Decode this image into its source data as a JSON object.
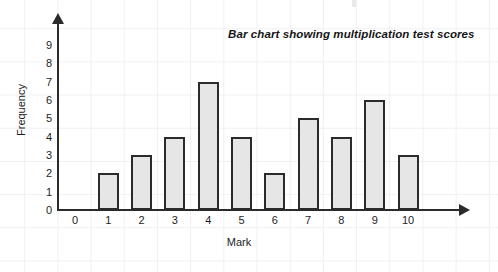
{
  "chart_data": {
    "type": "bar",
    "title": "Bar chart showing multiplication test scores",
    "xlabel": "Mark",
    "ylabel": "Frequency",
    "categories": [
      "0",
      "1",
      "2",
      "3",
      "4",
      "5",
      "6",
      "7",
      "8",
      "9",
      "10"
    ],
    "values": [
      0,
      2,
      3,
      4,
      7,
      4,
      2,
      5,
      4,
      6,
      3
    ],
    "yticks": [
      "0",
      "1",
      "2",
      "3",
      "4",
      "5",
      "6",
      "7",
      "8",
      "9"
    ],
    "ylim": [
      0,
      9
    ],
    "grid": true,
    "legend": "none",
    "bar_fill_color": "#e6e6e6",
    "bar_border_color": "#2b2b2b",
    "axis_color": "#2b2b2b",
    "grid_color": "#eef0f2",
    "background_color": "#ffffff"
  }
}
